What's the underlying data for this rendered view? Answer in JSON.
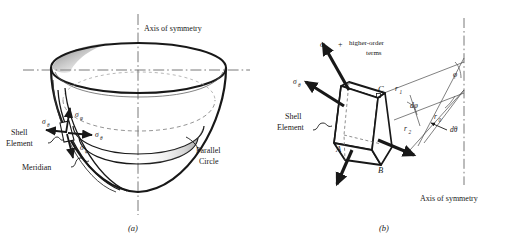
{
  "figure": {
    "background": "#ffffff",
    "ink": "#181818",
    "panels": [
      {
        "id": "a",
        "caption": "(a)",
        "title_label": "Axis of symmetry",
        "labels": {
          "shell_element_line1": "Shell",
          "shell_element_line2": "Element",
          "meridian": "Meridian",
          "parallel_circle_line1": "Parallel",
          "parallel_circle_line2": "Circle"
        },
        "stress_symbols": [
          {
            "name": "sigma-theta-left",
            "base": "σ",
            "sub": "θ"
          },
          {
            "name": "sigma-phi-upper",
            "base": "σ",
            "sub": "φ"
          },
          {
            "name": "sigma-theta-right",
            "base": "σ",
            "sub": "θ"
          },
          {
            "name": "sigma-phi-lower",
            "base": "σ",
            "sub": "φ"
          }
        ]
      },
      {
        "id": "b",
        "caption": "(b)",
        "axis_label": "Axis of symmetry",
        "labels": {
          "higher_order_line1": "higher-order",
          "higher_order_line2": "terms",
          "plus_sign": "+",
          "shell_element_line1": "Shell",
          "shell_element_line2": "Element"
        },
        "vertices": [
          "A",
          "B",
          "C"
        ],
        "geometry_symbols": [
          {
            "name": "radius-r1",
            "base": "r",
            "sub": "1"
          },
          {
            "name": "radius-r2",
            "base": "r",
            "sub": "2"
          },
          {
            "name": "radius-r0",
            "base": "r",
            "sub": "0"
          },
          {
            "name": "angle-dphi",
            "base": "dφ",
            "sub": ""
          },
          {
            "name": "angle-dtheta",
            "base": "dθ",
            "sub": ""
          },
          {
            "name": "angle-phi",
            "base": "φ",
            "sub": ""
          }
        ],
        "stress_symbols": [
          {
            "name": "sigma-phi-top",
            "base": "σ",
            "sub": "φ"
          },
          {
            "name": "sigma-theta-top",
            "base": "σ",
            "sub": "θ"
          },
          {
            "name": "sigma-theta-bottom",
            "base": "σ",
            "sub": "θ"
          },
          {
            "name": "sigma-phi-bottom",
            "base": "σ",
            "sub": "φ"
          }
        ]
      }
    ]
  }
}
